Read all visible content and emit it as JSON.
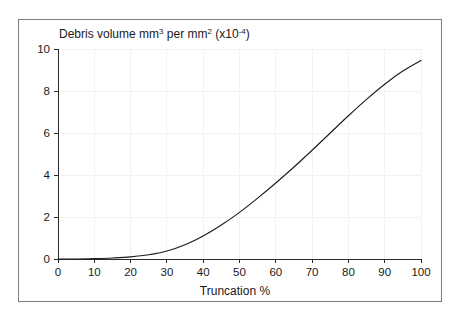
{
  "caption_remnant": "",
  "figure": {
    "frame_border_color": "#7c7c7c",
    "background_color": "#ffffff"
  },
  "chart_data": {
    "type": "line",
    "title": "",
    "y_axis_title_parts": {
      "text_1": "Debris volume mm",
      "sup_1": "3",
      "text_2": " per mm",
      "sup_2": "2",
      "text_3": " (x10",
      "sup_3": "-4",
      "text_4": ")"
    },
    "y_axis_title_plain": "Debris volume mm3 per mm2 (x10-4)",
    "xlabel": "Truncation %",
    "ylabel": "",
    "xlim": [
      0,
      100
    ],
    "ylim": [
      0,
      10
    ],
    "x_ticks": [
      0,
      10,
      20,
      30,
      40,
      50,
      60,
      70,
      80,
      90,
      100
    ],
    "y_ticks": [
      0,
      2,
      4,
      6,
      8,
      10
    ],
    "x_tick_labels": [
      "0",
      "10",
      "20",
      "30",
      "40",
      "50",
      "60",
      "70",
      "80",
      "90",
      "100"
    ],
    "y_tick_labels": [
      "0",
      "2",
      "4",
      "6",
      "8",
      "10"
    ],
    "grid": true,
    "legend": null,
    "series": [
      {
        "name": "Debris volume",
        "color": "#1d1d1d",
        "x": [
          0,
          5,
          10,
          15,
          20,
          25,
          30,
          35,
          40,
          45,
          50,
          55,
          60,
          65,
          70,
          75,
          80,
          85,
          90,
          95,
          100
        ],
        "values": [
          0.0,
          0.0,
          0.02,
          0.05,
          0.1,
          0.2,
          0.38,
          0.68,
          1.1,
          1.62,
          2.22,
          2.9,
          3.62,
          4.38,
          5.18,
          6.0,
          6.82,
          7.6,
          8.32,
          8.95,
          9.45
        ]
      }
    ]
  }
}
